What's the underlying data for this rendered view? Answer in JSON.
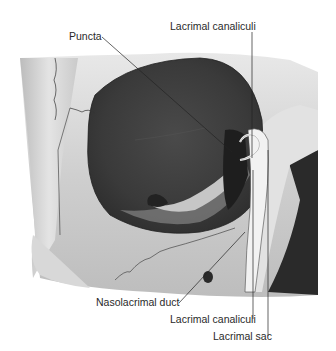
{
  "figure": {
    "labels": {
      "puncta": "Puncta",
      "canaliculi_top": "Lacrimal canaliculi",
      "nasolacrimal_duct": "Nasolacrimal duct",
      "canaliculi_bottom": "Lacrimal canaliculi",
      "lacrimal_sac": "Lacrimal sac"
    }
  }
}
